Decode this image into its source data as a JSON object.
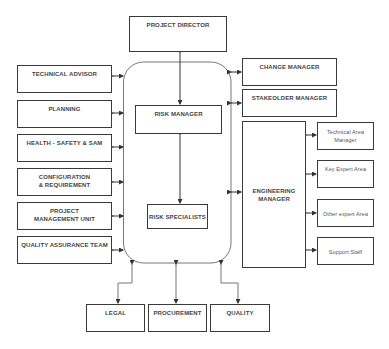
{
  "diagram": {
    "top": {
      "project_director": "PROJECT DIRECTOR"
    },
    "left": [
      "TECHNICAL ADVISOR",
      "PLANNING",
      "HEALTH - SAFETY & SAM",
      "CONFIGURATION & REQUIREMENT",
      "PROJECT MANAGEMENT UNIT",
      "QUALITY ASSURANCE TEAM"
    ],
    "center": {
      "risk_manager": "RISK MANAGER",
      "risk_specialists": "RISK SPECIALISTS"
    },
    "right": {
      "change_manager": "CHANGE MANAGER",
      "stakeholder_manager": "STAKEOLDER MANAGER",
      "engineering_manager": "ENGINEERING MANAGER",
      "engineering_areas": [
        "Technical Area Manager",
        "Key Expert Area",
        "Other expert Area",
        "Support Staff"
      ]
    },
    "bottom": [
      "LEGAL",
      "PROCUREMENT",
      "QUALITY"
    ]
  }
}
